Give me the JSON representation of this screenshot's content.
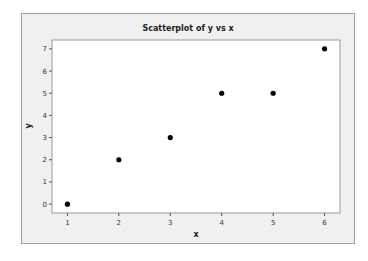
{
  "chart_data": {
    "type": "scatter",
    "title": "Scatterplot of y vs x",
    "xlabel": "x",
    "ylabel": "y",
    "x": [
      1,
      2,
      3,
      4,
      5,
      6
    ],
    "y": [
      0,
      2,
      3,
      5,
      5,
      7
    ],
    "xlim": [
      0.7,
      6.3
    ],
    "ylim": [
      -0.4,
      7.4
    ],
    "xticks": [
      1,
      2,
      3,
      4,
      5,
      6
    ],
    "yticks": [
      0,
      1,
      2,
      3,
      4,
      5,
      6,
      7
    ],
    "grid": false,
    "legend": null,
    "marker_color": "#000000",
    "background": "#f0f0f0",
    "plot_background": "#ffffff"
  }
}
